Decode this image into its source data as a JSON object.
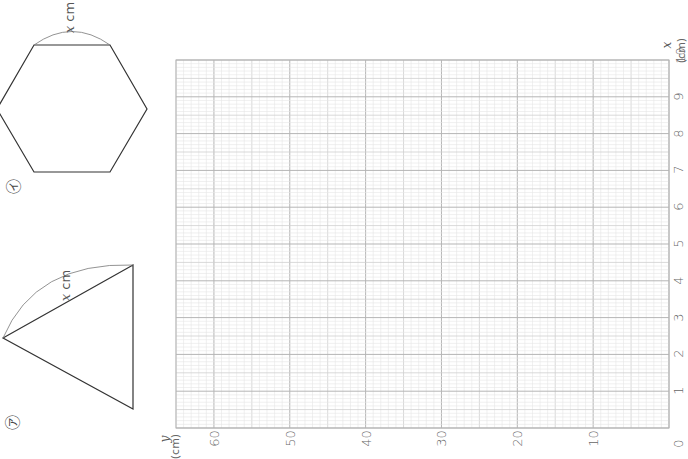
{
  "figures": {
    "a": {
      "marker": "㋐",
      "shape": "isosceles triangle",
      "side_label_var": "x",
      "side_label_unit": "cm"
    },
    "i": {
      "marker": "㋑",
      "shape": "regular hexagon",
      "side_label_var": "x",
      "side_label_unit": "cm"
    }
  },
  "graph": {
    "x_axis": {
      "var": "x",
      "unit": "(cm)",
      "ticks": [
        "0",
        "1",
        "2",
        "3",
        "4",
        "5",
        "6",
        "7",
        "8",
        "9",
        "10"
      ]
    },
    "y_axis": {
      "var": "y",
      "unit": "(cm)",
      "ticks": [
        "10",
        "20",
        "30",
        "40",
        "50",
        "60"
      ]
    },
    "origin_label": "0",
    "grid": {
      "x_range": [
        0,
        10
      ],
      "y_range": [
        0,
        65
      ],
      "minor_step_x": 0.1,
      "minor_step_y": 1
    }
  },
  "chart_data": {
    "type": "line",
    "title": "",
    "xlabel": "x (cm)",
    "ylabel": "y (cm)",
    "xlim": [
      0,
      10
    ],
    "ylim": [
      0,
      65
    ],
    "x_ticks": [
      0,
      1,
      2,
      3,
      4,
      5,
      6,
      7,
      8,
      9,
      10
    ],
    "y_ticks": [
      0,
      10,
      20,
      30,
      40,
      50,
      60
    ],
    "grid": true,
    "series": [],
    "orientation": "rotated 90° counter-clockwise (x axis vertical on right, y axis horizontal on bottom)"
  },
  "colors": {
    "grid_minor": "#e6e6e6",
    "grid_mid": "#cfcfcf",
    "grid_major": "#b5b5b5",
    "stroke": "#333333"
  }
}
